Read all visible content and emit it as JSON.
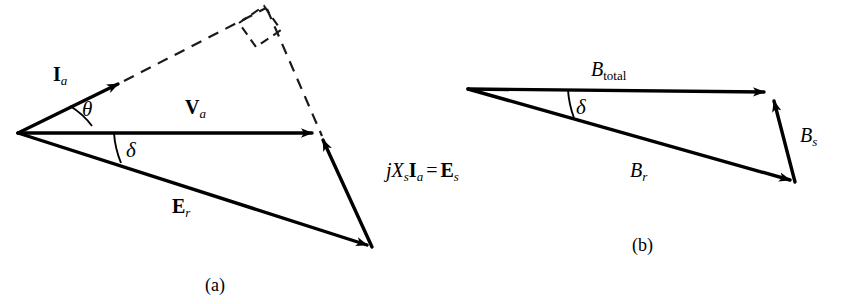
{
  "figure": {
    "background_color": "#ffffff",
    "stroke_color": "#000000",
    "width": 841,
    "height": 304
  },
  "panel_a": {
    "caption": "(a)",
    "labels": {
      "current": {
        "base": "I",
        "sub": "a",
        "style": "bold-roman"
      },
      "terminal_voltage": {
        "base": "V",
        "sub": "a",
        "style": "bold-roman"
      },
      "resultant_emf": {
        "base": "E",
        "sub": "r",
        "style": "bold-roman"
      },
      "reactance_drop": {
        "j": "j",
        "x": "X",
        "x_sub": "s",
        "i": "I",
        "i_sub": "a",
        "equals": "=",
        "e": "E",
        "e_sub": "s",
        "full_text": "jXsIa = Es"
      },
      "angle_theta": "θ",
      "angle_delta": "δ"
    },
    "geometry": {
      "origin": [
        18,
        133
      ],
      "ia_tip": [
        122,
        82
      ],
      "va_tip": [
        318,
        133
      ],
      "er_tip": [
        372,
        247
      ],
      "apex_dashed": [
        266,
        8
      ],
      "right_angle_marker": [
        252,
        21
      ]
    }
  },
  "panel_b": {
    "caption": "(b)",
    "labels": {
      "total_flux": {
        "base": "B",
        "sub": "total",
        "style": "italic-roman-sub"
      },
      "rotor_flux": {
        "base": "B",
        "sub": "r",
        "style": "italic"
      },
      "stator_flux": {
        "base": "B",
        "sub": "s",
        "style": "italic"
      },
      "angle_delta": "δ"
    },
    "geometry": {
      "origin": [
        468,
        89
      ],
      "btotal_tip": [
        770,
        92
      ],
      "br_tip": [
        795,
        182
      ],
      "bs_tail": [
        795,
        182
      ],
      "bs_tip": [
        772,
        95
      ]
    }
  }
}
